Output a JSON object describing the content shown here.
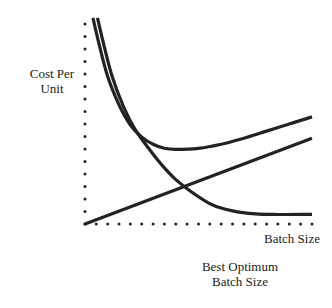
{
  "chart_data": {
    "type": "line",
    "title": "",
    "xlabel": "Batch Size",
    "ylabel": "Cost Per Unit",
    "annotation": "Best Optimum Batch Size",
    "xlim": [
      0,
      10
    ],
    "ylim": [
      0,
      10
    ],
    "axes_style": "dotted",
    "grid": false,
    "legend": "none",
    "line_color": "#222222",
    "series": [
      {
        "name": "Total cost per unit",
        "x": [
          0.35,
          0.6,
          1.0,
          1.5,
          2.0,
          2.5,
          3.0,
          3.5,
          4.0,
          5.0,
          6.0,
          7.0,
          8.0,
          9.0,
          10.0
        ],
        "y": [
          10.2,
          9.0,
          7.3,
          5.9,
          4.9,
          4.3,
          3.95,
          3.75,
          3.7,
          3.75,
          3.95,
          4.25,
          4.6,
          4.95,
          5.3
        ]
      },
      {
        "name": "Setup cost per unit",
        "x": [
          0.55,
          0.8,
          1.2,
          1.7,
          2.2,
          2.8,
          3.4,
          4.0,
          4.8,
          5.6,
          6.5,
          7.5,
          8.5,
          10.0
        ],
        "y": [
          10.2,
          9.0,
          7.3,
          5.8,
          4.7,
          3.75,
          2.9,
          2.2,
          1.5,
          0.95,
          0.65,
          0.5,
          0.47,
          0.48
        ]
      },
      {
        "name": "Carrying cost per unit",
        "x": [
          0,
          10
        ],
        "y": [
          0,
          4.25
        ]
      }
    ]
  }
}
